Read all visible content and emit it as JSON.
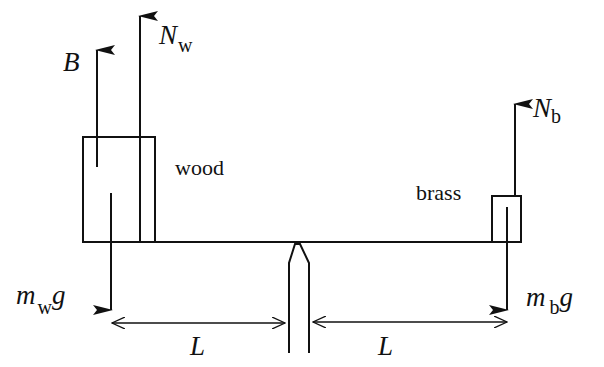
{
  "diagram": {
    "type": "free-body diagram",
    "colors": {
      "stroke": "#111111",
      "background": "#ffffff"
    },
    "objects": {
      "wood": {
        "label": "wood"
      },
      "brass": {
        "label": "brass"
      }
    },
    "forces": {
      "buoyancy": {
        "symbol": "B",
        "subscript": ""
      },
      "normal_wood": {
        "symbol": "N",
        "subscript": "w"
      },
      "weight_wood": {
        "symbol": "m",
        "subscript": "w",
        "suffix": "g"
      },
      "normal_brass": {
        "symbol": "N",
        "subscript": "b"
      },
      "weight_brass": {
        "symbol": "m",
        "subscript": "b",
        "suffix": "g"
      }
    },
    "dimensions": {
      "left": {
        "label": "L"
      },
      "right": {
        "label": "L"
      }
    }
  }
}
